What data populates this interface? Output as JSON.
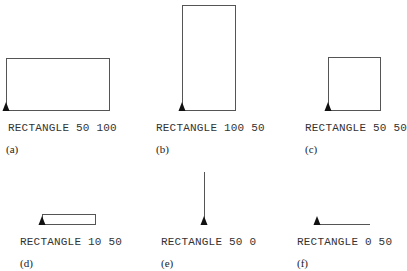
{
  "panels": [
    {
      "id": "a",
      "caption": "(a)",
      "command": "RECTANGLE 50 100",
      "height": 50,
      "width": 100,
      "shape": {
        "kind": "rect",
        "x": 6,
        "y": 58,
        "w": 103,
        "h": 52
      },
      "turtle": {
        "x": 6,
        "y": 110
      },
      "label_pos": {
        "x": 8,
        "y": 122
      },
      "cap_pos": {
        "x": 6,
        "y": 143
      }
    },
    {
      "id": "b",
      "caption": "(b)",
      "command": "RECTANGLE 100 50",
      "height": 100,
      "width": 50,
      "shape": {
        "kind": "rect",
        "x": 182,
        "y": 5,
        "w": 53,
        "h": 105
      },
      "turtle": {
        "x": 182,
        "y": 110
      },
      "label_pos": {
        "x": 156,
        "y": 122
      },
      "cap_pos": {
        "x": 156,
        "y": 143
      }
    },
    {
      "id": "c",
      "caption": "(c)",
      "command": "RECTANGLE 50 50",
      "height": 50,
      "width": 50,
      "shape": {
        "kind": "rect",
        "x": 328,
        "y": 57,
        "w": 52,
        "h": 53
      },
      "turtle": {
        "x": 328,
        "y": 110
      },
      "label_pos": {
        "x": 305,
        "y": 122
      },
      "cap_pos": {
        "x": 305,
        "y": 143
      }
    },
    {
      "id": "d",
      "caption": "(d)",
      "command": "RECTANGLE 10 50",
      "height": 10,
      "width": 50,
      "shape": {
        "kind": "rect",
        "x": 42,
        "y": 214,
        "w": 53,
        "h": 10
      },
      "turtle": {
        "x": 42,
        "y": 224
      },
      "label_pos": {
        "x": 20,
        "y": 236
      },
      "cap_pos": {
        "x": 20,
        "y": 257
      }
    },
    {
      "id": "e",
      "caption": "(e)",
      "command": "RECTANGLE 50 0",
      "height": 50,
      "width": 0,
      "shape": {
        "kind": "vline",
        "x": 204,
        "y1": 172,
        "y2": 224
      },
      "turtle": {
        "x": 204,
        "y": 224
      },
      "label_pos": {
        "x": 161,
        "y": 236
      },
      "cap_pos": {
        "x": 161,
        "y": 257
      }
    },
    {
      "id": "f",
      "caption": "(f)",
      "command": "RECTANGLE 0 50",
      "height": 0,
      "width": 50,
      "shape": {
        "kind": "hline",
        "x1": 317,
        "x2": 370,
        "y": 224
      },
      "turtle": {
        "x": 317,
        "y": 224
      },
      "label_pos": {
        "x": 297,
        "y": 236
      },
      "cap_pos": {
        "x": 297,
        "y": 257
      }
    }
  ],
  "colors": {
    "stroke": "#555555",
    "turtle": "#111111",
    "text": "#333333"
  }
}
